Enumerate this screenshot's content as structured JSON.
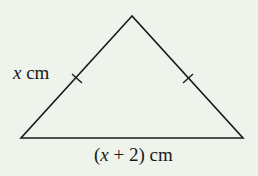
{
  "diagram": {
    "type": "isosceles-triangle",
    "background_color": "#eef3ec",
    "stroke_color": "#1a1a1a",
    "vertices": {
      "apex": [
        132,
        16
      ],
      "bottom_left": [
        21,
        138
      ],
      "bottom_right": [
        243,
        138
      ]
    },
    "equal_side_tick_marks": 2,
    "labels": {
      "left_side": {
        "variable": "x",
        "unit": " cm"
      },
      "base": {
        "open_paren": "(",
        "variable": "x",
        "rest": " + 2)",
        "unit": " cm"
      }
    }
  }
}
